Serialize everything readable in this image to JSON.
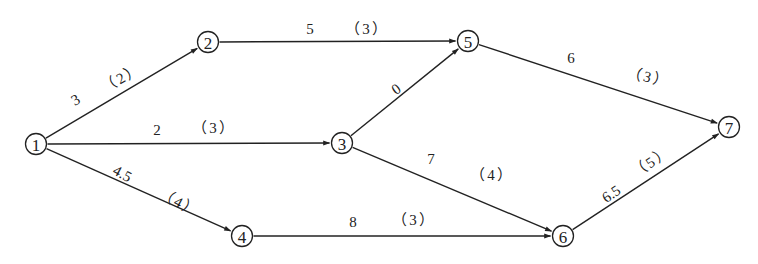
{
  "diagram": {
    "type": "activity-on-arrow network",
    "nodes": [
      {
        "id": "1",
        "label": "1",
        "x": 36,
        "y": 144
      },
      {
        "id": "2",
        "label": "2",
        "x": 208,
        "y": 42
      },
      {
        "id": "3",
        "label": "3",
        "x": 342,
        "y": 143
      },
      {
        "id": "4",
        "label": "4",
        "x": 242,
        "y": 236
      },
      {
        "id": "5",
        "label": "5",
        "x": 468,
        "y": 41
      },
      {
        "id": "6",
        "label": "6",
        "x": 563,
        "y": 236
      },
      {
        "id": "7",
        "label": "7",
        "x": 729,
        "y": 127
      }
    ],
    "edges": [
      {
        "from": "1",
        "to": "2",
        "duration": "3",
        "bracket": "（2）",
        "dur_pos": [
          78,
          104
        ],
        "dur_rot": -30,
        "br_pos": [
          124,
          82
        ],
        "br_rot": -30
      },
      {
        "from": "1",
        "to": "3",
        "duration": "2",
        "bracket": "（3）",
        "dur_pos": [
          157,
          135
        ],
        "dur_rot": 0,
        "br_pos": [
          214,
          133
        ],
        "br_rot": 0
      },
      {
        "from": "1",
        "to": "4",
        "duration": "4.5",
        "bracket": "（4）",
        "dur_pos": [
          120,
          178
        ],
        "dur_rot": 28,
        "br_pos": [
          177,
          207
        ],
        "br_rot": 28
      },
      {
        "from": "2",
        "to": "5",
        "duration": "5",
        "bracket": "（3）",
        "dur_pos": [
          310,
          34
        ],
        "dur_rot": 0,
        "br_pos": [
          367,
          34
        ],
        "br_rot": 0
      },
      {
        "from": "3",
        "to": "5",
        "duration": "0",
        "bracket": "",
        "dur_pos": [
          399,
          93
        ],
        "dur_rot": -36,
        "br_pos": [
          0,
          0
        ],
        "br_rot": 0
      },
      {
        "from": "3",
        "to": "6",
        "duration": "7",
        "bracket": "（4）",
        "dur_pos": [
          431,
          164
        ],
        "dur_rot": 0,
        "br_pos": [
          492,
          180
        ],
        "br_rot": 0
      },
      {
        "from": "4",
        "to": "6",
        "duration": "8",
        "bracket": "（3）",
        "dur_pos": [
          353,
          227
        ],
        "dur_rot": 0,
        "br_pos": [
          414,
          225
        ],
        "br_rot": 0
      },
      {
        "from": "5",
        "to": "7",
        "duration": "6",
        "bracket": "（3）",
        "dur_pos": [
          571,
          63
        ],
        "dur_rot": 0,
        "br_pos": [
          647,
          82
        ],
        "br_rot": 14
      },
      {
        "from": "6",
        "to": "7",
        "duration": "6.5",
        "bracket": "（5）",
        "dur_pos": [
          614,
          198
        ],
        "dur_rot": -34,
        "br_pos": [
          654,
          166
        ],
        "br_rot": -34
      }
    ]
  }
}
